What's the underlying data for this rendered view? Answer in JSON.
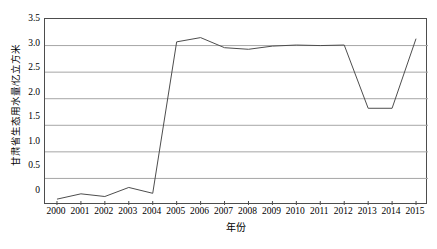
{
  "chart_data": {
    "type": "line",
    "title": "",
    "xlabel": "年份",
    "ylabel": "甘肃省生态用水量/亿立方米",
    "categories": [
      "2000",
      "2001",
      "2002",
      "2003",
      "2004",
      "2005",
      "2006",
      "2007",
      "2008",
      "2009",
      "2010",
      "2011",
      "2012",
      "2013",
      "2014",
      "2015"
    ],
    "values": [
      0.11,
      0.21,
      0.16,
      0.33,
      0.22,
      3.07,
      3.15,
      2.96,
      2.93,
      2.99,
      3.01,
      3.0,
      3.01,
      1.82,
      1.82,
      3.13
    ],
    "series": [
      {
        "name": "甘肃省生态用水量",
        "values": [
          0.11,
          0.21,
          0.16,
          0.33,
          0.22,
          3.07,
          3.15,
          2.96,
          2.93,
          2.99,
          3.01,
          3.0,
          3.01,
          1.82,
          1.82,
          3.13
        ]
      }
    ],
    "ylim": [
      0,
      3.5
    ],
    "yticks": [
      0,
      0.5,
      1.0,
      1.5,
      2.0,
      2.5,
      3.0,
      3.5
    ],
    "ytick_labels": [
      "0",
      "0.5",
      "1.0",
      "1.5",
      "2.0",
      "2.5",
      "3.0",
      "3.5"
    ],
    "xtick_labels": [
      "2000",
      "2001",
      "2002",
      "2003",
      "2004",
      "2005",
      "2006",
      "2007",
      "2008",
      "2009",
      "2010",
      "2011",
      "2012",
      "2013",
      "2014",
      "2015"
    ],
    "grid": "horizontal",
    "legend": "none",
    "markers": "none",
    "colors": {
      "line": "#4d4d4d",
      "grid": "#a6a6a6",
      "axis": "#4d4d4d",
      "text": "#000000",
      "background": "#ffffff"
    }
  }
}
